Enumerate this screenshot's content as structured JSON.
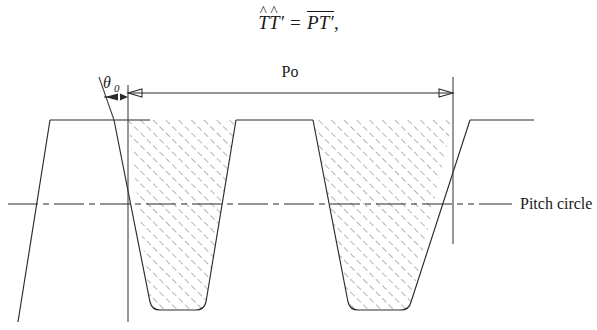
{
  "figure": {
    "equation": {
      "lhs": {
        "sym1": "T",
        "hat1": "^",
        "sym2": "T",
        "hat2": "^",
        "prime2": "′"
      },
      "operator": "=",
      "rhs": {
        "sym1": "P",
        "sym2": "T",
        "prime2": "′"
      },
      "trailing_punctuation": ",",
      "plain_text": "T̂T̂′ = PT′,"
    },
    "labels": {
      "pitch_label": "Po",
      "angle_symbol": "θ",
      "angle_subscript": "0",
      "angle_full": "θ0",
      "pitch_circle_label": "Pitch circle"
    },
    "colors": {
      "line": "#2b2b2b",
      "hatch": "#6e6e6e",
      "background": "#ffffff",
      "text": "#1a1a1a"
    },
    "geometry": {
      "description": "Gear tooth / rack profile cross-section showing two hatched tooth spaces",
      "top_land_y": 76,
      "root_y": 264,
      "pitch_circle_y": 160,
      "tooth_space_count": 2,
      "reference_line_x": [
        128,
        453
      ],
      "pitch_dimension_span_x": [
        128,
        453
      ],
      "pressure_angle_marker_x": [
        104,
        128
      ]
    }
  }
}
